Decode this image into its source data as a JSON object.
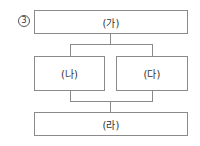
{
  "question": {
    "choice_marker": "3"
  },
  "diagram": {
    "top": {
      "label": "(가)"
    },
    "middle_left": {
      "label": "(나)"
    },
    "middle_right": {
      "label": "(다)"
    },
    "bottom": {
      "label": "(라)"
    }
  },
  "colors": {
    "line": "#8a8a8a",
    "text": "#333333",
    "background": "#ffffff"
  }
}
